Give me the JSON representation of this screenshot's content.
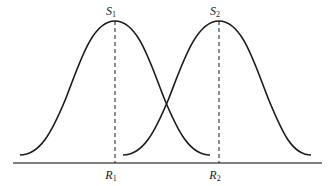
{
  "diagram": {
    "type": "overlapping-bell-curves",
    "labels": {
      "s1": "S",
      "s1_sub": "1",
      "s2": "S",
      "s2_sub": "2",
      "r1": "R",
      "r1_sub": "1",
      "r2": "R",
      "r2_sub": "2"
    },
    "curves": [
      {
        "name": "curve-1",
        "peak_label": "S1",
        "base_label": "R1"
      },
      {
        "name": "curve-2",
        "peak_label": "S2",
        "base_label": "R2"
      }
    ],
    "colors": {
      "stroke": "#1a1a1a",
      "axis": "#555555",
      "background": "#ffffff"
    }
  }
}
